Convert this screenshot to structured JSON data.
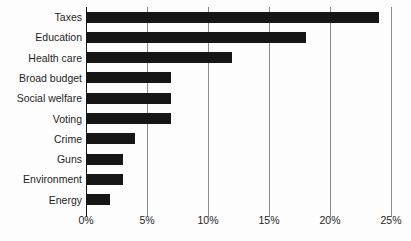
{
  "chart_data": {
    "type": "bar",
    "orientation": "horizontal",
    "title": "",
    "subtitle": "",
    "xlabel": "",
    "ylabel": "",
    "categories": [
      "Taxes",
      "Education",
      "Health care",
      "Broad budget",
      "Social welfare",
      "Voting",
      "Crime",
      "Guns",
      "Environment",
      "Energy"
    ],
    "values": [
      24,
      18,
      12,
      7,
      7,
      7,
      4,
      3,
      3,
      2
    ],
    "value_unit": "%",
    "xlim": [
      0,
      25
    ],
    "xticks": [
      0,
      5,
      10,
      15,
      20,
      25
    ],
    "xtick_labels": [
      "0%",
      "5%",
      "10%",
      "15%",
      "20%",
      "25%"
    ],
    "grid": "vertical",
    "legend": "none",
    "bar_color": "#161616",
    "gridline_color": "#8a8a8a",
    "axis_color": "#121212",
    "background_color": "#fdfdfd",
    "text_color": "#1d1d1d"
  }
}
